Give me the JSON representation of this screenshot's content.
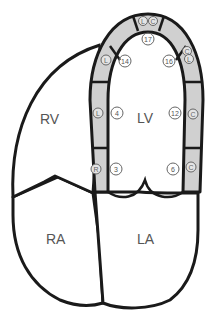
{
  "diagram": {
    "chambers": [
      {
        "id": "rv",
        "label": "RV"
      },
      {
        "id": "lv",
        "label": "LV"
      },
      {
        "id": "ra",
        "label": "RA"
      },
      {
        "id": "la",
        "label": "LA"
      }
    ],
    "segments": [
      {
        "number": "17",
        "position": "apex"
      },
      {
        "number": "14",
        "position": "apical-septal"
      },
      {
        "number": "16",
        "position": "apical-lateral"
      },
      {
        "number": "4",
        "position": "mid-septal"
      },
      {
        "number": "12",
        "position": "mid-lateral"
      },
      {
        "number": "3",
        "position": "basal-septal"
      },
      {
        "number": "6",
        "position": "basal-lateral"
      }
    ],
    "artery_markers": [
      {
        "letter": "L",
        "position": "apex-left"
      },
      {
        "letter": "C",
        "position": "apex-right"
      },
      {
        "letter": "L",
        "position": "apical-septal-wall"
      },
      {
        "letter": "C",
        "position": "apical-lateral-wall-top"
      },
      {
        "letter": "L",
        "position": "apical-lateral-wall-bottom"
      },
      {
        "letter": "L",
        "position": "mid-septal-wall"
      },
      {
        "letter": "C",
        "position": "mid-lateral-wall"
      },
      {
        "letter": "R",
        "position": "basal-septal-wall"
      },
      {
        "letter": "C",
        "position": "basal-lateral-wall"
      }
    ],
    "colors": {
      "outline": "#1a1a1a",
      "wall_fill": "#d0d0d0",
      "label": "#555555",
      "background": "#ffffff"
    }
  }
}
